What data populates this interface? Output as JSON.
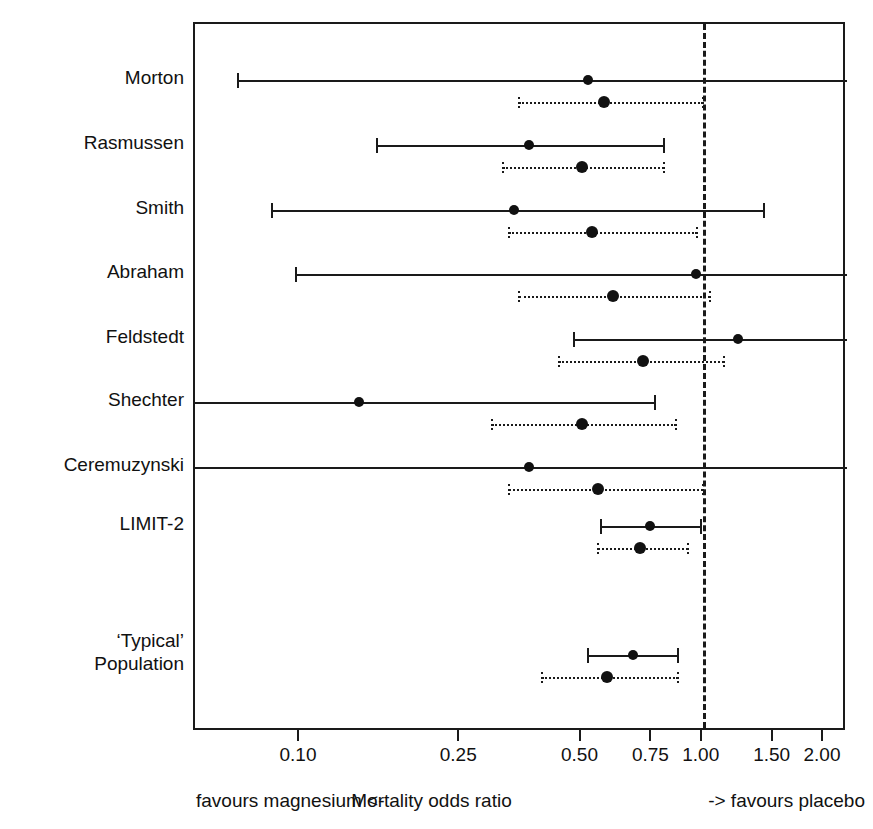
{
  "chart_data": {
    "type": "forest",
    "title": "",
    "xlabel": "Mortality odds ratio",
    "ylabel": "",
    "xscale": "log",
    "xlim": [
      0.065,
      2.2
    ],
    "grid": false,
    "reference_line": 1.0,
    "tick_values": [
      0.1,
      0.25,
      0.5,
      0.75,
      1.0,
      1.5,
      2.0
    ],
    "tick_labels": [
      "0.10",
      "0.25",
      "0.50",
      "0.75",
      "1.00",
      "1.50",
      "2.00"
    ],
    "left_annotation": "favours magnesium  <-",
    "right_annotation": "->  favours placebo",
    "series": [
      {
        "name": "classical (solid)",
        "style": "solid"
      },
      {
        "name": "Bayesian posterior (dotted)",
        "style": "dotted"
      }
    ],
    "categories": [
      "Morton",
      "Rasmussen",
      "Smith",
      "Abraham",
      "Feldstedt",
      "Shechter",
      "Ceremuzynski",
      "LIMIT-2",
      "'Typical' Population"
    ],
    "rows": [
      {
        "label": "Morton",
        "label_lines": [
          "Morton"
        ],
        "solid": {
          "estimate": 0.52,
          "lower": 0.07,
          "upper": 2.5,
          "lower_clipped": false,
          "upper_clipped": true
        },
        "dotted": {
          "estimate": 0.57,
          "lower": 0.35,
          "upper": 1.0,
          "lower_clipped": false,
          "upper_clipped": false
        }
      },
      {
        "label": "Rasmussen",
        "label_lines": [
          "Rasmussen"
        ],
        "solid": {
          "estimate": 0.37,
          "lower": 0.155,
          "upper": 0.8,
          "lower_clipped": false,
          "upper_clipped": false
        },
        "dotted": {
          "estimate": 0.5,
          "lower": 0.32,
          "upper": 0.8,
          "lower_clipped": false,
          "upper_clipped": false
        }
      },
      {
        "label": "Smith",
        "label_lines": [
          "Smith"
        ],
        "solid": {
          "estimate": 0.34,
          "lower": 0.085,
          "upper": 1.42,
          "lower_clipped": false,
          "upper_clipped": false
        },
        "dotted": {
          "estimate": 0.53,
          "lower": 0.33,
          "upper": 0.97,
          "lower_clipped": false,
          "upper_clipped": false
        }
      },
      {
        "label": "Abraham",
        "label_lines": [
          "Abraham"
        ],
        "solid": {
          "estimate": 0.96,
          "lower": 0.098,
          "upper": 2.5,
          "lower_clipped": false,
          "upper_clipped": true
        },
        "dotted": {
          "estimate": 0.6,
          "lower": 0.35,
          "upper": 1.04,
          "lower_clipped": false,
          "upper_clipped": false
        }
      },
      {
        "label": "Feldstedt",
        "label_lines": [
          "Feldstedt"
        ],
        "solid": {
          "estimate": 1.22,
          "lower": 0.48,
          "upper": 2.5,
          "lower_clipped": false,
          "upper_clipped": true
        },
        "dotted": {
          "estimate": 0.71,
          "lower": 0.44,
          "upper": 1.13,
          "lower_clipped": false,
          "upper_clipped": false
        }
      },
      {
        "label": "Shechter",
        "label_lines": [
          "Shechter"
        ],
        "solid": {
          "estimate": 0.14,
          "lower": 0.04,
          "upper": 0.76,
          "lower_clipped": true,
          "upper_clipped": false
        },
        "dotted": {
          "estimate": 0.5,
          "lower": 0.3,
          "upper": 0.86,
          "lower_clipped": false,
          "upper_clipped": false
        }
      },
      {
        "label": "Ceremuzynski",
        "label_lines": [
          "Ceremuzynski"
        ],
        "solid": {
          "estimate": 0.37,
          "lower": 0.04,
          "upper": 2.5,
          "lower_clipped": true,
          "upper_clipped": true
        },
        "dotted": {
          "estimate": 0.55,
          "lower": 0.33,
          "upper": 1.0,
          "lower_clipped": false,
          "upper_clipped": false
        }
      },
      {
        "label": "LIMIT-2",
        "label_lines": [
          "LIMIT-2"
        ],
        "solid": {
          "estimate": 0.74,
          "lower": 0.56,
          "upper": 0.99,
          "lower_clipped": false,
          "upper_clipped": false
        },
        "dotted": {
          "estimate": 0.7,
          "lower": 0.55,
          "upper": 0.92,
          "lower_clipped": false,
          "upper_clipped": false
        }
      },
      {
        "label": "'Typical' Population",
        "label_lines": [
          "‘Typical’",
          "Population"
        ],
        "solid": {
          "estimate": 0.67,
          "lower": 0.52,
          "upper": 0.87,
          "lower_clipped": false,
          "upper_clipped": false
        },
        "dotted": {
          "estimate": 0.58,
          "lower": 0.4,
          "upper": 0.87,
          "lower_clipped": false,
          "upper_clipped": false
        }
      }
    ]
  },
  "axis": {
    "ticks": [
      {
        "value": 0.1,
        "label": "0.10"
      },
      {
        "value": 0.25,
        "label": "0.25"
      },
      {
        "value": 0.5,
        "label": "0.50"
      },
      {
        "value": 0.75,
        "label": "0.75"
      },
      {
        "value": 1.0,
        "label": "1.00"
      },
      {
        "value": 1.5,
        "label": "1.50"
      },
      {
        "value": 2.0,
        "label": "2.00"
      }
    ]
  },
  "footer": {
    "left": "favours magnesium  <-",
    "center": "Mortality odds ratio",
    "right": "->  favours placebo"
  },
  "colors": {
    "ink": "#1a1a1a",
    "background": "#ffffff"
  }
}
